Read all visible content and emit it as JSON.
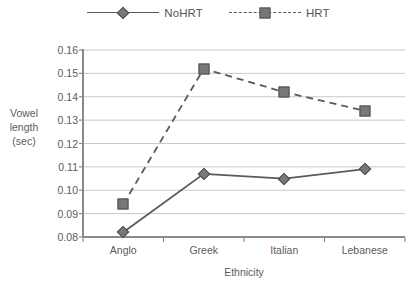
{
  "chart_data": {
    "type": "line",
    "title": "",
    "xlabel": "Ethnicity",
    "ylabel": "Vowel length (sec)",
    "ylabel_lines": [
      "Vowel",
      "length",
      "(sec)"
    ],
    "categories": [
      "Anglo",
      "Greek",
      "Italian",
      "Lebanese"
    ],
    "yticks": [
      "0.16",
      "0.15",
      "0.14",
      "0.13",
      "0.12",
      "0.11",
      "0.10",
      "0.09",
      "0.08"
    ],
    "ytick_values": [
      0.16,
      0.15,
      0.14,
      0.13,
      0.12,
      0.11,
      0.1,
      0.09,
      0.08
    ],
    "ylim": [
      0.08,
      0.16
    ],
    "grid": true,
    "legend_position": "top-center",
    "series": [
      {
        "name": "NoHRT",
        "values": [
          0.082,
          0.107,
          0.105,
          0.109
        ],
        "line_style": "solid",
        "marker": "diamond",
        "color": "#787878"
      },
      {
        "name": "HRT",
        "values": [
          0.094,
          0.152,
          0.142,
          0.134
        ],
        "line_style": "dashed",
        "marker": "square",
        "color": "#787878"
      }
    ]
  },
  "legend": {
    "items": [
      {
        "label": "NoHRT",
        "marker": "diamond-marker",
        "style": "solid"
      },
      {
        "label": "HRT",
        "marker": "square-marker",
        "style": "dashed"
      }
    ]
  },
  "colors": {
    "marker_fill": "#787878",
    "marker_stroke": "#4f4f4f",
    "line": "#5a5a5a",
    "grid": "#c9c9c9",
    "axis": "#8a8a8a",
    "text": "#5c5c5c",
    "background": "#ffffff"
  }
}
